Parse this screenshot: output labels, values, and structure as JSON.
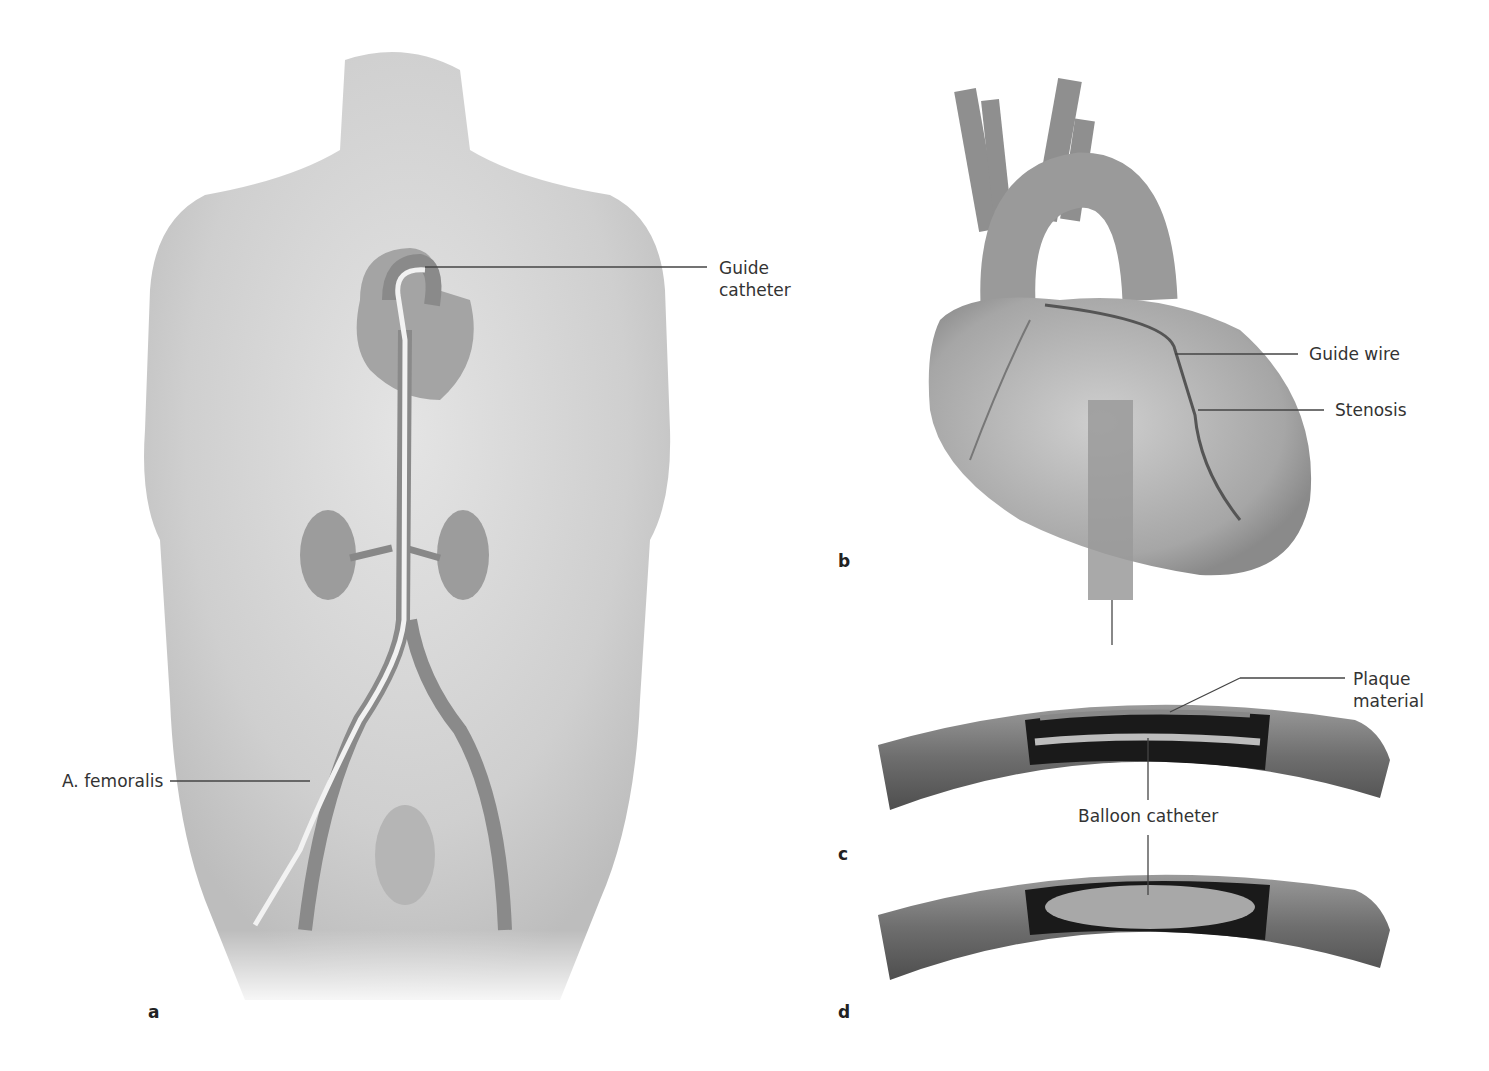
{
  "figure": {
    "panels": [
      {
        "id": "a",
        "letter": "a",
        "subject": "anterior body view with catheter from femoral artery to heart"
      },
      {
        "id": "b",
        "letter": "b",
        "subject": "heart with guide wire at coronary stenosis"
      },
      {
        "id": "c",
        "letter": "c",
        "subject": "vessel cutaway with deflated balloon catheter at plaque"
      },
      {
        "id": "d",
        "letter": "d",
        "subject": "vessel cutaway with inflated balloon catheter"
      }
    ],
    "labels": {
      "guide_catheter_line1": "Guide",
      "guide_catheter_line2": "catheter",
      "femoral": "A. femoralis",
      "guide_wire": "Guide wire",
      "stenosis": "Stenosis",
      "plaque_line1": "Plaque",
      "plaque_line2": "material",
      "balloon_catheter": "Balloon catheter"
    },
    "colors": {
      "skin": "#d9d9d9",
      "organ": "#9a9a9a",
      "vessel": "#7a7a7a",
      "lumen": "#1a1a1a",
      "leader_line": "#444444",
      "text": "#333333"
    }
  }
}
